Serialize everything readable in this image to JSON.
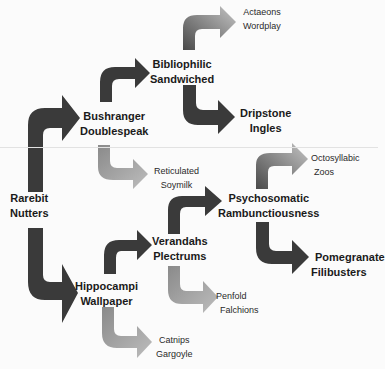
{
  "colors": {
    "dark_arrow": "#3a3a3a",
    "gradient_start": "#4a4a4a",
    "gradient_end": "#bdbdbd",
    "background": "#fbfbfb"
  },
  "nodes": {
    "root": {
      "line1": "Rarebit",
      "line2": "Nutters"
    },
    "bushranger": {
      "line1": "Bushranger",
      "line2": "Doublespeak"
    },
    "bibliophilic": {
      "line1": "Bibliophilic",
      "line2": "Sandwiched"
    },
    "actaeons": {
      "line1": "Actaeons",
      "line2": "Wordplay"
    },
    "dripstone": {
      "line1": "Dripstone",
      "line2": "Ingles"
    },
    "reticulated": {
      "line1": "Reticulated",
      "line2": "Soymilk"
    },
    "hippocampi": {
      "line1": "Hippocampi",
      "line2": "Wallpaper"
    },
    "verandahs": {
      "line1": "Verandahs",
      "line2": "Plectrums"
    },
    "catnips": {
      "line1": "Catnips",
      "line2": "Gargoyle"
    },
    "psychosomatic": {
      "line1": "Psychosomatic",
      "line2": "Rambunctiousness"
    },
    "penfold": {
      "line1": "Penfold",
      "line2": "Falchions"
    },
    "octosyllabic": {
      "line1": "Octosyllabic",
      "line2": "Zoos"
    },
    "pomegranate": {
      "line1": "Pomegranate",
      "line2": "Filibusters"
    }
  }
}
